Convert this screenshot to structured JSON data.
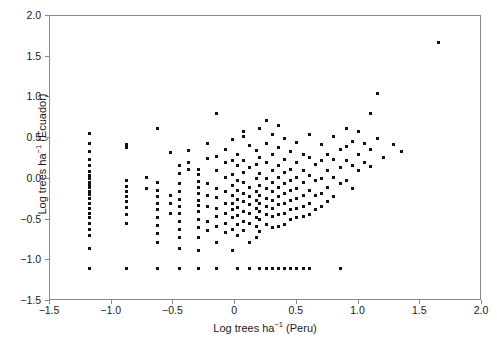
{
  "chart_data": {
    "type": "scatter",
    "title": "",
    "xlabel": "Log trees ha-1 (Peru)",
    "ylabel": "Log trees ha-1 (Ecuador)",
    "xlabel_parts": {
      "pre": "Log trees ha",
      "sup": "−1",
      "post": " (Peru)"
    },
    "ylabel_parts": {
      "pre": "Log trees ha",
      "sup": "−1",
      "post": " (Ecuador)"
    },
    "xlim": [
      -1.5,
      2.0
    ],
    "ylim": [
      -1.5,
      2.0
    ],
    "xticks": [
      -1.5,
      -1.0,
      -0.5,
      0,
      0.5,
      1.0,
      1.5,
      2.0
    ],
    "xticklabels": [
      "−1.5",
      "−1.0",
      "−0.5",
      "0",
      "0.5",
      "1.0",
      "1.5",
      "2.0"
    ],
    "yticks": [
      -1.5,
      -1.0,
      -0.5,
      0.0,
      0.5,
      1.0,
      1.5,
      2.0
    ],
    "yticklabels": [
      "−1.5",
      "−1.0",
      "−0.5",
      "0.0",
      "0.5",
      "1.0",
      "1.5",
      "2.0"
    ],
    "grid": false,
    "legend": false,
    "marker": "square",
    "marker_color": "#111111",
    "marker_size_px": 3,
    "frame_color": "#8a8a8a",
    "background": "#ffffff",
    "n_points": 268,
    "points": [
      [
        -1.18,
        0.56
      ],
      [
        -1.18,
        0.43
      ],
      [
        -1.18,
        0.33
      ],
      [
        -1.18,
        0.24
      ],
      [
        -1.18,
        0.17
      ],
      [
        -1.18,
        0.09
      ],
      [
        -1.18,
        0.04
      ],
      [
        -1.18,
        0.0
      ],
      [
        -1.18,
        -0.04
      ],
      [
        -1.18,
        -0.07
      ],
      [
        -1.18,
        -0.11
      ],
      [
        -1.18,
        -0.15
      ],
      [
        -1.18,
        -0.19
      ],
      [
        -1.18,
        -0.24
      ],
      [
        -1.18,
        -0.3
      ],
      [
        -1.18,
        -0.36
      ],
      [
        -1.18,
        -0.42
      ],
      [
        -1.18,
        -0.48
      ],
      [
        -1.18,
        -0.55
      ],
      [
        -1.18,
        -0.62
      ],
      [
        -1.18,
        -0.7
      ],
      [
        -1.18,
        -0.85
      ],
      [
        -1.18,
        -1.1
      ],
      [
        -0.88,
        0.42
      ],
      [
        -0.88,
        0.38
      ],
      [
        -0.88,
        -0.02
      ],
      [
        -0.88,
        -0.09
      ],
      [
        -0.88,
        -0.16
      ],
      [
        -0.88,
        -0.22
      ],
      [
        -0.88,
        -0.28
      ],
      [
        -0.88,
        -0.35
      ],
      [
        -0.88,
        -0.44
      ],
      [
        -0.88,
        -0.55
      ],
      [
        -0.88,
        -1.1
      ],
      [
        -0.72,
        0.02
      ],
      [
        -0.72,
        -0.12
      ],
      [
        -0.63,
        0.62
      ],
      [
        -0.63,
        -0.05
      ],
      [
        -0.63,
        -0.14
      ],
      [
        -0.63,
        -0.22
      ],
      [
        -0.63,
        -0.3
      ],
      [
        -0.63,
        -0.38
      ],
      [
        -0.63,
        -0.47
      ],
      [
        -0.63,
        -0.57
      ],
      [
        -0.63,
        -0.67
      ],
      [
        -0.63,
        -0.78
      ],
      [
        -0.63,
        -1.1
      ],
      [
        -0.52,
        0.32
      ],
      [
        -0.52,
        -0.2
      ],
      [
        -0.52,
        -0.3
      ],
      [
        -0.52,
        -0.42
      ],
      [
        -0.45,
        0.17
      ],
      [
        -0.45,
        0.06
      ],
      [
        -0.45,
        -0.06
      ],
      [
        -0.45,
        -0.15
      ],
      [
        -0.45,
        -0.25
      ],
      [
        -0.45,
        -0.34
      ],
      [
        -0.45,
        -0.43
      ],
      [
        -0.45,
        -0.52
      ],
      [
        -0.45,
        -0.62
      ],
      [
        -0.45,
        -0.72
      ],
      [
        -0.45,
        -0.85
      ],
      [
        -0.45,
        -1.1
      ],
      [
        -0.38,
        0.35
      ],
      [
        -0.38,
        0.2
      ],
      [
        -0.38,
        0.12
      ],
      [
        -0.3,
        0.12
      ],
      [
        -0.3,
        0.05
      ],
      [
        -0.3,
        -0.03
      ],
      [
        -0.3,
        -0.1
      ],
      [
        -0.3,
        -0.18
      ],
      [
        -0.3,
        -0.26
      ],
      [
        -0.3,
        -0.33
      ],
      [
        -0.3,
        -0.4
      ],
      [
        -0.3,
        -0.5
      ],
      [
        -0.3,
        -0.6
      ],
      [
        -0.3,
        -0.72
      ],
      [
        -0.3,
        -0.88
      ],
      [
        -0.3,
        -1.1
      ],
      [
        -0.22,
        0.43
      ],
      [
        -0.22,
        0.25
      ],
      [
        -0.22,
        -0.06
      ],
      [
        -0.22,
        -0.2
      ],
      [
        -0.22,
        -0.34
      ],
      [
        -0.22,
        -0.52
      ],
      [
        -0.22,
        -0.64
      ],
      [
        -0.15,
        0.8
      ],
      [
        -0.15,
        0.28
      ],
      [
        -0.15,
        0.1
      ],
      [
        -0.15,
        -0.12
      ],
      [
        -0.15,
        -0.23
      ],
      [
        -0.15,
        -0.36
      ],
      [
        -0.15,
        -0.46
      ],
      [
        -0.15,
        -0.58
      ],
      [
        -0.15,
        -0.78
      ],
      [
        -0.15,
        -1.1
      ],
      [
        -0.08,
        0.36
      ],
      [
        -0.08,
        0.2
      ],
      [
        -0.08,
        0.02
      ],
      [
        -0.08,
        -0.16
      ],
      [
        -0.08,
        -0.3
      ],
      [
        -0.08,
        -0.42
      ],
      [
        -0.08,
        -0.55
      ],
      [
        -0.08,
        -0.66
      ],
      [
        -0.02,
        0.48
      ],
      [
        -0.02,
        0.22
      ],
      [
        -0.02,
        0.05
      ],
      [
        -0.02,
        -0.08
      ],
      [
        -0.02,
        -0.2
      ],
      [
        -0.02,
        -0.3
      ],
      [
        -0.02,
        -0.38
      ],
      [
        -0.02,
        -0.48
      ],
      [
        -0.02,
        -0.62
      ],
      [
        -0.02,
        -0.88
      ],
      [
        0.02,
        0.3
      ],
      [
        0.02,
        0.16
      ],
      [
        0.02,
        -0.02
      ],
      [
        0.02,
        -0.14
      ],
      [
        0.02,
        -0.25
      ],
      [
        0.02,
        -0.35
      ],
      [
        0.02,
        -0.45
      ],
      [
        0.02,
        -0.56
      ],
      [
        0.02,
        -0.7
      ],
      [
        0.02,
        -1.1
      ],
      [
        0.07,
        0.58
      ],
      [
        0.07,
        0.52
      ],
      [
        0.07,
        0.22
      ],
      [
        0.07,
        0.08
      ],
      [
        0.07,
        -0.05
      ],
      [
        0.07,
        -0.18
      ],
      [
        0.07,
        -0.28
      ],
      [
        0.07,
        -0.4
      ],
      [
        0.07,
        -0.52
      ],
      [
        0.07,
        -0.64
      ],
      [
        0.12,
        0.41
      ],
      [
        0.12,
        0.14
      ],
      [
        0.12,
        -0.1
      ],
      [
        0.12,
        -0.22
      ],
      [
        0.12,
        -0.32
      ],
      [
        0.12,
        -0.42
      ],
      [
        0.12,
        -0.55
      ],
      [
        0.12,
        -0.78
      ],
      [
        0.12,
        -1.1
      ],
      [
        0.17,
        0.35
      ],
      [
        0.17,
        0.18
      ],
      [
        0.17,
        0.0
      ],
      [
        0.17,
        -0.15
      ],
      [
        0.17,
        -0.27
      ],
      [
        0.17,
        -0.37
      ],
      [
        0.17,
        -0.47
      ],
      [
        0.17,
        -0.58
      ],
      [
        0.17,
        -0.72
      ],
      [
        0.2,
        0.62
      ],
      [
        0.2,
        0.26
      ],
      [
        0.2,
        0.06
      ],
      [
        0.2,
        -0.08
      ],
      [
        0.2,
        -0.2
      ],
      [
        0.2,
        -0.3
      ],
      [
        0.2,
        -0.4
      ],
      [
        0.2,
        -0.5
      ],
      [
        0.2,
        -0.65
      ],
      [
        0.2,
        -1.1
      ],
      [
        0.25,
        0.72
      ],
      [
        0.25,
        0.44
      ],
      [
        0.25,
        0.2
      ],
      [
        0.25,
        0.0
      ],
      [
        0.25,
        -0.12
      ],
      [
        0.25,
        -0.24
      ],
      [
        0.25,
        -0.34
      ],
      [
        0.25,
        -0.44
      ],
      [
        0.25,
        -0.56
      ],
      [
        0.25,
        -1.1
      ],
      [
        0.3,
        0.54
      ],
      [
        0.3,
        0.3
      ],
      [
        0.3,
        0.1
      ],
      [
        0.3,
        -0.04
      ],
      [
        0.3,
        -0.16
      ],
      [
        0.3,
        -0.26
      ],
      [
        0.3,
        -0.36
      ],
      [
        0.3,
        -0.46
      ],
      [
        0.3,
        -0.6
      ],
      [
        0.3,
        -1.1
      ],
      [
        0.35,
        0.66
      ],
      [
        0.35,
        0.38
      ],
      [
        0.35,
        0.16
      ],
      [
        0.35,
        0.02
      ],
      [
        0.35,
        -0.1
      ],
      [
        0.35,
        -0.22
      ],
      [
        0.35,
        -0.32
      ],
      [
        0.35,
        -0.44
      ],
      [
        0.35,
        -0.58
      ],
      [
        0.35,
        -1.1
      ],
      [
        0.4,
        0.5
      ],
      [
        0.4,
        0.24
      ],
      [
        0.4,
        0.08
      ],
      [
        0.4,
        -0.06
      ],
      [
        0.4,
        -0.18
      ],
      [
        0.4,
        -0.3
      ],
      [
        0.4,
        -0.42
      ],
      [
        0.4,
        -0.56
      ],
      [
        0.4,
        -1.1
      ],
      [
        0.45,
        0.34
      ],
      [
        0.45,
        0.12
      ],
      [
        0.45,
        -0.02
      ],
      [
        0.45,
        -0.14
      ],
      [
        0.45,
        -0.26
      ],
      [
        0.45,
        -0.38
      ],
      [
        0.45,
        -0.5
      ],
      [
        0.45,
        -1.1
      ],
      [
        0.5,
        0.45
      ],
      [
        0.5,
        0.2
      ],
      [
        0.5,
        0.02
      ],
      [
        0.5,
        -0.12
      ],
      [
        0.5,
        -0.24
      ],
      [
        0.5,
        -0.36
      ],
      [
        0.5,
        -0.48
      ],
      [
        0.5,
        -1.1
      ],
      [
        0.55,
        0.3
      ],
      [
        0.55,
        0.1
      ],
      [
        0.55,
        -0.05
      ],
      [
        0.55,
        -0.2
      ],
      [
        0.55,
        -0.34
      ],
      [
        0.55,
        -0.46
      ],
      [
        0.55,
        -1.1
      ],
      [
        0.6,
        0.55
      ],
      [
        0.6,
        0.26
      ],
      [
        0.6,
        0.04
      ],
      [
        0.6,
        -0.14
      ],
      [
        0.6,
        -0.3
      ],
      [
        0.6,
        -0.44
      ],
      [
        0.6,
        -1.1
      ],
      [
        0.65,
        0.18
      ],
      [
        0.65,
        -0.02
      ],
      [
        0.65,
        -0.2
      ],
      [
        0.65,
        -0.38
      ],
      [
        0.7,
        0.42
      ],
      [
        0.7,
        0.22
      ],
      [
        0.7,
        0.0
      ],
      [
        0.7,
        -0.18
      ],
      [
        0.7,
        -0.34
      ],
      [
        0.75,
        0.3
      ],
      [
        0.75,
        0.1
      ],
      [
        0.75,
        -0.1
      ],
      [
        0.75,
        -0.28
      ],
      [
        0.8,
        0.52
      ],
      [
        0.8,
        0.24
      ],
      [
        0.8,
        0.02
      ],
      [
        0.8,
        -0.22
      ],
      [
        0.85,
        0.36
      ],
      [
        0.85,
        0.14
      ],
      [
        0.85,
        -0.06
      ],
      [
        0.85,
        -1.1
      ],
      [
        0.9,
        0.62
      ],
      [
        0.9,
        0.4
      ],
      [
        0.9,
        0.22
      ],
      [
        0.9,
        -0.02
      ],
      [
        0.95,
        0.46
      ],
      [
        0.95,
        0.16
      ],
      [
        0.95,
        -0.12
      ],
      [
        1.0,
        0.58
      ],
      [
        1.0,
        0.3
      ],
      [
        1.0,
        0.1
      ],
      [
        1.05,
        0.44
      ],
      [
        1.05,
        0.2
      ],
      [
        1.1,
        0.8
      ],
      [
        1.1,
        0.36
      ],
      [
        1.1,
        0.15
      ],
      [
        1.15,
        1.05
      ],
      [
        1.15,
        0.5
      ],
      [
        1.2,
        0.26
      ],
      [
        1.28,
        0.42
      ],
      [
        1.35,
        0.34
      ],
      [
        1.65,
        1.67
      ]
    ]
  }
}
